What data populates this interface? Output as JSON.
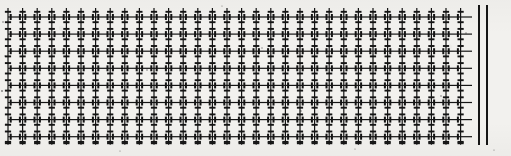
{
  "figure": {
    "kind": "scanned-lattice-texture",
    "width": 511,
    "height": 156,
    "background_color": "#f2f1ee",
    "ink_color": "#141414"
  },
  "lattice": {
    "label": "grid-lattice",
    "origin_x": 8,
    "origin_y": 17,
    "column_count": 32,
    "row_count": 8,
    "column_spacing": 14.6,
    "row_spacing": 17.1,
    "grid_left": 8,
    "grid_right": 472,
    "grid_top": 17,
    "grid_bottom": 137,
    "rule_thickness": 1.2,
    "vertical_overhang_top": 9,
    "vertical_overhang_bottom": 8,
    "tick": {
      "label": "cross-tick-mark",
      "half_width": 3.1,
      "thickness": 1.9,
      "vertical_half_height": 3.0,
      "vertical_thickness": 2.0,
      "offsets_along_column": [
        -5.2,
        5.2
      ],
      "offsets_along_row": [
        -4.6,
        4.6
      ]
    }
  },
  "right_bars": {
    "label": "vertical-rule-pair",
    "count": 2,
    "top": 5,
    "bottom": 145,
    "width": 2.4,
    "positions_x": [
      477.5,
      485.5
    ],
    "color": "#161616"
  },
  "speckles": {
    "label": "scan-speckle",
    "points": [
      {
        "x": 3,
        "y": 22,
        "r": 0.8
      },
      {
        "x": 5,
        "y": 56,
        "r": 0.7
      },
      {
        "x": 2,
        "y": 91,
        "r": 0.9
      },
      {
        "x": 6,
        "y": 124,
        "r": 0.7
      },
      {
        "x": 147,
        "y": 70,
        "r": 0.8
      },
      {
        "x": 262,
        "y": 48,
        "r": 0.7
      },
      {
        "x": 301,
        "y": 111,
        "r": 0.8
      },
      {
        "x": 388,
        "y": 64,
        "r": 0.7
      },
      {
        "x": 441,
        "y": 96,
        "r": 0.8
      },
      {
        "x": 466,
        "y": 33,
        "r": 0.7
      },
      {
        "x": 494,
        "y": 150,
        "r": 0.6
      },
      {
        "x": 120,
        "y": 151,
        "r": 0.6
      },
      {
        "x": 222,
        "y": 6,
        "r": 0.6
      },
      {
        "x": 355,
        "y": 149,
        "r": 0.6
      }
    ]
  }
}
